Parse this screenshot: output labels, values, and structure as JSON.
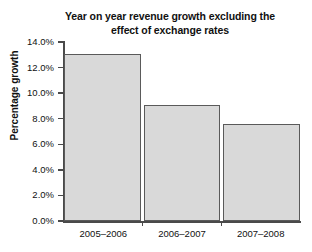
{
  "chart_data": {
    "type": "bar",
    "title": "Year on year revenue growth excluding the effect of exchange rates",
    "title_line1": "Year on year revenue growth excluding the",
    "title_line2": "effect of exchange rates",
    "xlabel": "",
    "ylabel": "Percentage growth",
    "categories": [
      "2005–2006",
      "2006–2007",
      "2007–2008"
    ],
    "values": [
      13.1,
      9.1,
      7.6
    ],
    "value_labels": [
      "13.1%",
      "9.1%",
      "7.6%"
    ],
    "ylim": [
      0,
      14
    ],
    "ytick_values": [
      14.0,
      12.0,
      10.0,
      8.0,
      6.0,
      4.0,
      2.0,
      0.0
    ],
    "ytick_labels": [
      "14.0%",
      "12.0%",
      "10.0%",
      "8.0%",
      "6.0%",
      "4.0%",
      "2.0%",
      "0.0%"
    ],
    "grid": false,
    "legend": null,
    "bar_fill_color": "#d9d9d9",
    "bar_border_color": "#5a5a5a",
    "axis_color": "#4a4a4a",
    "text_color": "#111111",
    "background_color": "#ffffff"
  }
}
